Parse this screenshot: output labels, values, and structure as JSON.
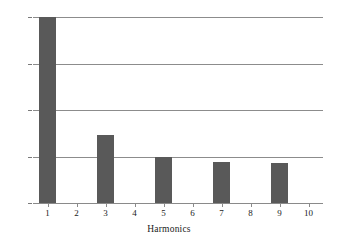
{
  "chart_data": {
    "type": "bar",
    "title": "",
    "subtitle": "",
    "xlabel": "Harmonics",
    "ylabel": "",
    "categories": [
      "1",
      "2",
      "3",
      "4",
      "5",
      "6",
      "7",
      "8",
      "9",
      "10"
    ],
    "values": [
      100,
      0,
      36.5,
      0,
      25,
      0,
      22,
      0,
      21.5,
      0
    ],
    "series": [
      {
        "name": "Harmonic amplitude",
        "values": [
          100,
          0,
          36.5,
          0,
          25,
          0,
          22,
          0,
          21.5,
          0
        ]
      }
    ],
    "xlim": [
      0.5,
      10.5
    ],
    "ylim": [
      0,
      100
    ],
    "yticks": [
      0,
      25,
      50,
      75,
      100
    ],
    "ytick_labels": [
      "0",
      "25",
      "50",
      "75",
      "100"
    ],
    "xticks": [
      1,
      2,
      3,
      4,
      5,
      6,
      7,
      8,
      9,
      10
    ],
    "xtick_labels": [
      "1",
      "2",
      "3",
      "4",
      "5",
      "6",
      "7",
      "8",
      "9",
      "10"
    ],
    "grid": "horizontal",
    "legend": "none",
    "annotations": [],
    "colors": {
      "bar": "#595959",
      "gridline": "#8c8c8c",
      "axis": "#8a8a8a",
      "text": "#1a1a1a",
      "background": "#ffffff"
    }
  }
}
